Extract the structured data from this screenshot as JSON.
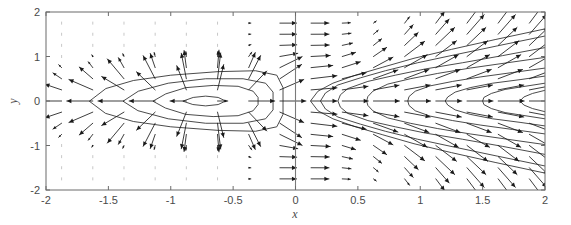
{
  "figure": {
    "background_color": "#ffffff",
    "frame_color": "#6b6b6b",
    "contour_color": "#2b2b2b",
    "arrow_color": "#1a1a1a",
    "faint_arrow_color": "#b9b9b9"
  },
  "axes": {
    "x_title": "x",
    "y_title": "y",
    "x_ticks": [
      "-2",
      "-1.5",
      "-1",
      "-0.5",
      "0",
      "0.5",
      "1",
      "1.5",
      "2"
    ],
    "y_ticks": [
      "-2",
      "-1",
      "0",
      "1",
      "2"
    ]
  },
  "chart_data": {
    "type": "line",
    "title": "",
    "subtitle": "",
    "xlabel": "x",
    "ylabel": "y",
    "xlim": [
      -2,
      2
    ],
    "ylim": [
      -2,
      2
    ],
    "grid": false,
    "legend": "none",
    "plot_kind": "contour-with-quiver-vector-field",
    "x_tick_values": [
      -2,
      -1.5,
      -1,
      -0.5,
      0,
      0.5,
      1,
      1.5,
      2
    ],
    "y_tick_values": [
      -2,
      -1,
      0,
      1,
      2
    ],
    "divider": {
      "orientation": "vertical",
      "x": 0,
      "y_from": -2,
      "y_to": 2
    },
    "quiver_grid": {
      "x_start": -1.875,
      "x_end": 1.875,
      "y_start": -1.75,
      "y_end": 1.75,
      "x_step": 0.25,
      "y_step": 0.25
    },
    "series": [
      {
        "name": "left-contour-level-1",
        "region": "left",
        "closed": true,
        "points": [
          [
            -1.65,
            0.0
          ],
          [
            -1.52,
            0.28
          ],
          [
            -1.3,
            0.46
          ],
          [
            -1.0,
            0.58
          ],
          [
            -0.62,
            0.66
          ],
          [
            -0.32,
            0.68
          ],
          [
            -0.15,
            0.58
          ],
          [
            -0.1,
            0.3
          ],
          [
            -0.1,
            0.0
          ],
          [
            -0.1,
            -0.3
          ],
          [
            -0.15,
            -0.58
          ],
          [
            -0.32,
            -0.68
          ],
          [
            -0.62,
            -0.66
          ],
          [
            -1.0,
            -0.58
          ],
          [
            -1.3,
            -0.46
          ],
          [
            -1.52,
            -0.28
          ]
        ]
      },
      {
        "name": "left-contour-level-2",
        "region": "left",
        "closed": true,
        "points": [
          [
            -1.38,
            0.0
          ],
          [
            -1.26,
            0.22
          ],
          [
            -1.02,
            0.4
          ],
          [
            -0.72,
            0.5
          ],
          [
            -0.42,
            0.5
          ],
          [
            -0.24,
            0.4
          ],
          [
            -0.18,
            0.2
          ],
          [
            -0.18,
            0.0
          ],
          [
            -0.18,
            -0.2
          ],
          [
            -0.24,
            -0.4
          ],
          [
            -0.42,
            -0.5
          ],
          [
            -0.72,
            -0.5
          ],
          [
            -1.02,
            -0.4
          ],
          [
            -1.26,
            -0.22
          ]
        ]
      },
      {
        "name": "left-contour-level-3",
        "region": "left",
        "closed": true,
        "points": [
          [
            -1.14,
            0.0
          ],
          [
            -1.04,
            0.16
          ],
          [
            -0.88,
            0.3
          ],
          [
            -0.66,
            0.35
          ],
          [
            -0.46,
            0.33
          ],
          [
            -0.34,
            0.22
          ],
          [
            -0.3,
            0.08
          ],
          [
            -0.3,
            0.0
          ],
          [
            -0.3,
            -0.08
          ],
          [
            -0.34,
            -0.22
          ],
          [
            -0.46,
            -0.33
          ],
          [
            -0.66,
            -0.35
          ],
          [
            -0.88,
            -0.3
          ],
          [
            -1.04,
            -0.16
          ]
        ]
      },
      {
        "name": "left-contour-level-4",
        "region": "left",
        "closed": true,
        "points": [
          [
            -0.9,
            0.0
          ],
          [
            -0.82,
            0.08
          ],
          [
            -0.72,
            0.11
          ],
          [
            -0.62,
            0.08
          ],
          [
            -0.56,
            0.0
          ],
          [
            -0.62,
            -0.08
          ],
          [
            -0.72,
            -0.11
          ],
          [
            -0.82,
            -0.08
          ]
        ]
      },
      {
        "name": "right-contour-level-1",
        "region": "right",
        "open": true,
        "vertex": [
          0.12,
          0.0
        ],
        "points": [
          [
            2.0,
            1.62
          ],
          [
            1.6,
            1.38
          ],
          [
            1.25,
            1.16
          ],
          [
            0.95,
            0.96
          ],
          [
            0.7,
            0.76
          ],
          [
            0.48,
            0.58
          ],
          [
            0.3,
            0.4
          ],
          [
            0.18,
            0.22
          ],
          [
            0.12,
            0.0
          ],
          [
            0.18,
            -0.22
          ],
          [
            0.3,
            -0.4
          ],
          [
            0.48,
            -0.58
          ],
          [
            0.7,
            -0.76
          ],
          [
            0.95,
            -0.96
          ],
          [
            1.25,
            -1.16
          ],
          [
            1.6,
            -1.38
          ],
          [
            2.0,
            -1.62
          ]
        ]
      },
      {
        "name": "right-contour-level-2",
        "region": "right",
        "open": true,
        "vertex": [
          0.2,
          0.0
        ],
        "points": [
          [
            2.0,
            1.46
          ],
          [
            1.62,
            1.24
          ],
          [
            1.28,
            1.04
          ],
          [
            0.98,
            0.86
          ],
          [
            0.72,
            0.68
          ],
          [
            0.52,
            0.52
          ],
          [
            0.34,
            0.36
          ],
          [
            0.24,
            0.18
          ],
          [
            0.2,
            0.0
          ],
          [
            0.24,
            -0.18
          ],
          [
            0.34,
            -0.36
          ],
          [
            0.52,
            -0.52
          ],
          [
            0.72,
            -0.68
          ],
          [
            0.98,
            -0.86
          ],
          [
            1.28,
            -1.04
          ],
          [
            1.62,
            -1.24
          ],
          [
            2.0,
            -1.46
          ]
        ]
      },
      {
        "name": "right-contour-level-3",
        "region": "right",
        "open": true,
        "vertex": [
          0.34,
          0.0
        ],
        "points": [
          [
            2.0,
            1.2
          ],
          [
            1.66,
            1.02
          ],
          [
            1.34,
            0.86
          ],
          [
            1.04,
            0.72
          ],
          [
            0.8,
            0.58
          ],
          [
            0.58,
            0.44
          ],
          [
            0.42,
            0.28
          ],
          [
            0.36,
            0.14
          ],
          [
            0.34,
            0.0
          ],
          [
            0.36,
            -0.14
          ],
          [
            0.42,
            -0.28
          ],
          [
            0.58,
            -0.44
          ],
          [
            0.8,
            -0.58
          ],
          [
            1.04,
            -0.72
          ],
          [
            1.34,
            -0.86
          ],
          [
            1.66,
            -1.02
          ],
          [
            2.0,
            -1.2
          ]
        ]
      },
      {
        "name": "right-contour-level-4",
        "region": "right",
        "open": true,
        "vertex": [
          0.57,
          0.0
        ],
        "points": [
          [
            2.0,
            0.98
          ],
          [
            1.7,
            0.86
          ],
          [
            1.4,
            0.74
          ],
          [
            1.14,
            0.62
          ],
          [
            0.92,
            0.5
          ],
          [
            0.74,
            0.38
          ],
          [
            0.62,
            0.22
          ],
          [
            0.58,
            0.1
          ],
          [
            0.57,
            0.0
          ],
          [
            0.58,
            -0.1
          ],
          [
            0.62,
            -0.22
          ],
          [
            0.74,
            -0.38
          ],
          [
            0.92,
            -0.5
          ],
          [
            1.14,
            -0.62
          ],
          [
            1.4,
            -0.74
          ],
          [
            1.7,
            -0.86
          ],
          [
            2.0,
            -0.98
          ]
        ]
      },
      {
        "name": "right-contour-level-5",
        "region": "right",
        "open": true,
        "vertex": [
          0.9,
          0.0
        ],
        "points": [
          [
            2.0,
            0.74
          ],
          [
            1.74,
            0.64
          ],
          [
            1.48,
            0.54
          ],
          [
            1.26,
            0.44
          ],
          [
            1.08,
            0.34
          ],
          [
            0.96,
            0.22
          ],
          [
            0.91,
            0.1
          ],
          [
            0.9,
            0.0
          ],
          [
            0.91,
            -0.1
          ],
          [
            0.96,
            -0.22
          ],
          [
            1.08,
            -0.34
          ],
          [
            1.26,
            -0.44
          ],
          [
            1.48,
            -0.54
          ],
          [
            1.74,
            -0.64
          ],
          [
            2.0,
            -0.74
          ]
        ]
      },
      {
        "name": "right-contour-level-6",
        "region": "right",
        "open": true,
        "vertex": [
          1.2,
          0.0
        ],
        "points": [
          [
            2.0,
            0.56
          ],
          [
            1.8,
            0.48
          ],
          [
            1.58,
            0.4
          ],
          [
            1.4,
            0.3
          ],
          [
            1.28,
            0.2
          ],
          [
            1.22,
            0.09
          ],
          [
            1.2,
            0.0
          ],
          [
            1.22,
            -0.09
          ],
          [
            1.28,
            -0.2
          ],
          [
            1.4,
            -0.3
          ],
          [
            1.58,
            -0.4
          ],
          [
            1.8,
            -0.48
          ],
          [
            2.0,
            -0.56
          ]
        ]
      },
      {
        "name": "right-contour-level-7",
        "region": "right",
        "open": true,
        "vertex": [
          1.5,
          0.0
        ],
        "points": [
          [
            2.0,
            0.4
          ],
          [
            1.84,
            0.33
          ],
          [
            1.68,
            0.26
          ],
          [
            1.57,
            0.17
          ],
          [
            1.51,
            0.08
          ],
          [
            1.5,
            0.0
          ],
          [
            1.51,
            -0.08
          ],
          [
            1.57,
            -0.17
          ],
          [
            1.68,
            -0.26
          ],
          [
            1.84,
            -0.33
          ],
          [
            2.0,
            -0.4
          ]
        ]
      },
      {
        "name": "right-contour-level-8",
        "region": "right",
        "open": true,
        "vertex": [
          1.8,
          0.0
        ],
        "points": [
          [
            2.0,
            0.24
          ],
          [
            1.9,
            0.17
          ],
          [
            1.83,
            0.09
          ],
          [
            1.8,
            0.0
          ],
          [
            1.83,
            -0.09
          ],
          [
            1.9,
            -0.17
          ],
          [
            2.0,
            -0.24
          ]
        ]
      }
    ]
  }
}
